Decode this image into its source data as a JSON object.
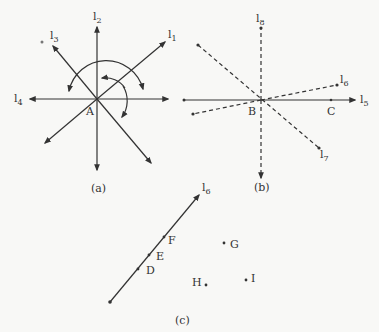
{
  "figure_a": {
    "caption": "(a)",
    "point": "A",
    "lines": [
      "l1",
      "l2",
      "l3",
      "l4"
    ],
    "labels": {
      "l1": "l",
      "l1_sub": "1",
      "l2": "l",
      "l2_sub": "2",
      "l3": "l",
      "l3_sub": "3",
      "l4": "l",
      "l4_sub": "4"
    }
  },
  "figure_b": {
    "caption": "(b)",
    "points": [
      "B",
      "C"
    ],
    "labels": {
      "l5": "l",
      "l5_sub": "5",
      "l6": "l",
      "l6_sub": "6",
      "l7": "l",
      "l7_sub": "7",
      "l8": "l",
      "l8_sub": "8"
    },
    "B": "B",
    "C": "C"
  },
  "figure_c": {
    "caption": "(c)",
    "line_label": "l",
    "line_label_sub": "6",
    "points_on_line": [
      "D",
      "E",
      "F"
    ],
    "points_off_line": [
      "G",
      "H",
      "I"
    ],
    "D": "D",
    "E": "E",
    "F": "F",
    "G": "G",
    "H": "H",
    "I": "I"
  }
}
